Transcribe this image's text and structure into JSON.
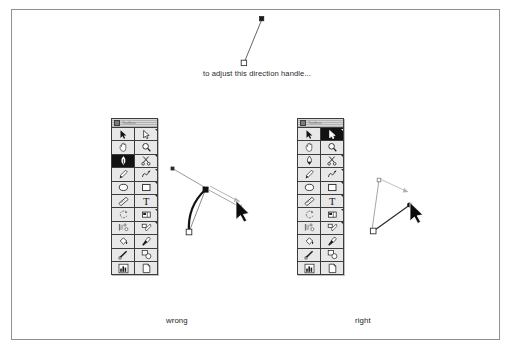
{
  "page": {
    "background_color": "#ffffff",
    "border_color": "#8d9196"
  },
  "caption": {
    "text": "to adjust this direction handle..."
  },
  "figures": {
    "wrong": {
      "label": "wrong",
      "description": "Pen tool dragging a direction handle which distorts the curve incorrectly"
    },
    "right": {
      "label": "right",
      "description": "Direct selection tool dragging the direction handle correctly"
    }
  },
  "top_handle": {
    "anchor_point": "hollow-square-anchor",
    "handle_point": "filled-square-handle",
    "line_color": "#555555"
  },
  "palettes": [
    {
      "name": "toolbox-wrong",
      "title": "Toolbox",
      "selected_tool": "pen-tool",
      "tools": [
        {
          "row": 1,
          "left": "selection-tool",
          "right": "direct-selection-tool"
        },
        {
          "row": 2,
          "left": "hand-tool",
          "right": "zoom-tool"
        },
        {
          "row": 3,
          "left": "pen-tool",
          "right": "scissors-tool"
        },
        {
          "row": 4,
          "left": "paintbrush-tool",
          "right": "freehand-tool"
        },
        {
          "row": 5,
          "left": "ellipse-tool",
          "right": "rectangle-tool"
        },
        {
          "row": 6,
          "left": "measure-tool",
          "right": "type-tool"
        },
        {
          "row": 7,
          "left": "rotate-tool",
          "right": "reflect-tool"
        },
        {
          "row": 8,
          "left": "blend-tool",
          "right": "scale-tool"
        },
        {
          "row": 9,
          "left": "paint-bucket-tool",
          "right": "eyedropper-tool"
        },
        {
          "row": 10,
          "left": "gradient-tool",
          "right": "auto-trace-tool"
        },
        {
          "row": 11,
          "left": "graph-tool",
          "right": "page-tool"
        }
      ]
    },
    {
      "name": "toolbox-right",
      "title": "Toolbox",
      "selected_tool": "direct-selection-tool",
      "tools": [
        {
          "row": 1,
          "left": "selection-tool",
          "right": "direct-selection-tool"
        },
        {
          "row": 2,
          "left": "hand-tool",
          "right": "zoom-tool"
        },
        {
          "row": 3,
          "left": "pen-tool",
          "right": "scissors-tool"
        },
        {
          "row": 4,
          "left": "paintbrush-tool",
          "right": "freehand-tool"
        },
        {
          "row": 5,
          "left": "ellipse-tool",
          "right": "rectangle-tool"
        },
        {
          "row": 6,
          "left": "measure-tool",
          "right": "type-tool"
        },
        {
          "row": 7,
          "left": "rotate-tool",
          "right": "reflect-tool"
        },
        {
          "row": 8,
          "left": "blend-tool",
          "right": "scale-tool"
        },
        {
          "row": 9,
          "left": "paint-bucket-tool",
          "right": "eyedropper-tool"
        },
        {
          "row": 10,
          "left": "gradient-tool",
          "right": "auto-trace-tool"
        },
        {
          "row": 11,
          "left": "graph-tool",
          "right": "page-tool"
        }
      ]
    }
  ],
  "colors": {
    "ink": "#1e1e1e",
    "gray_line": "#9a9a9a",
    "selected_bg": "#121212",
    "palette_bg": "#e8e8e8",
    "palette_border": "#3d3d3d"
  }
}
